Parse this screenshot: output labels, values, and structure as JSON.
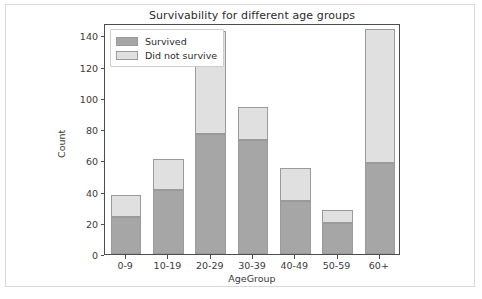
{
  "chart_data": {
    "type": "bar",
    "stacked": true,
    "title": "Survivability for different age groups",
    "xlabel": "AgeGroup",
    "ylabel": "Count",
    "categories": [
      "0-9",
      "10-19",
      "20-29",
      "30-39",
      "40-49",
      "50-59",
      "60+"
    ],
    "series": [
      {
        "name": "Survived",
        "color": "#a6a6a6",
        "values": [
          24,
          41,
          77,
          73,
          34,
          20,
          58
        ]
      },
      {
        "name": "Did not survive",
        "color": "#e0e0e0",
        "values": [
          14,
          20,
          66,
          21,
          21,
          8,
          86
        ]
      }
    ],
    "totals": [
      38,
      61,
      143,
      94,
      55,
      28,
      144
    ],
    "ylim": [
      0,
      148
    ],
    "yticks": [
      0,
      20,
      40,
      60,
      80,
      100,
      120,
      140
    ],
    "ytick_labels": [
      "0",
      "20",
      "40",
      "60",
      "80",
      "100",
      "120",
      "140"
    ],
    "grid": false,
    "legend_position": "upper left"
  },
  "legend": {
    "items": [
      {
        "label": "Survived",
        "color": "#a6a6a6"
      },
      {
        "label": "Did not survive",
        "color": "#e0e0e0"
      }
    ]
  }
}
